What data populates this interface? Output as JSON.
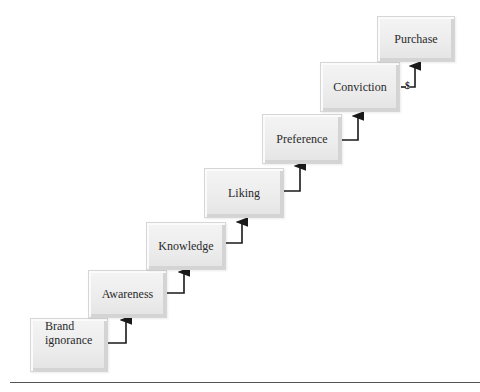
{
  "diagram": {
    "title_visible": false,
    "type": "staircase",
    "steps": [
      {
        "id": "brand-ignorance",
        "label": "Brand\nignorance",
        "line1": "Brand",
        "line2": "ignorance"
      },
      {
        "id": "awareness",
        "label": "Awareness"
      },
      {
        "id": "knowledge",
        "label": "Knowledge"
      },
      {
        "id": "liking",
        "label": "Liking"
      },
      {
        "id": "preference",
        "label": "Preference"
      },
      {
        "id": "conviction",
        "label": "Conviction"
      },
      {
        "id": "purchase",
        "label": "Purchase"
      }
    ],
    "purchase_connector_label": "$",
    "colors": {
      "box": "#ececec",
      "box_border": "#d6d6d6",
      "arrow": "#1a1a1a",
      "rule": "#555555"
    }
  }
}
